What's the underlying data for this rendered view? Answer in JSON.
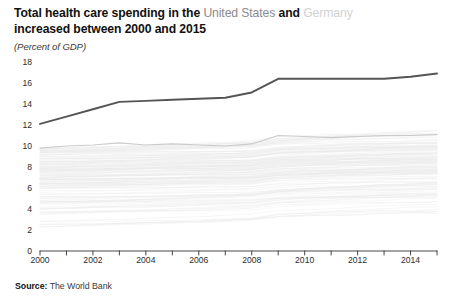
{
  "header": {
    "title_part1": "Total health care spending in the ",
    "title_highlight_us": "United States",
    "title_conjunction": " and ",
    "title_highlight_de": "Germany",
    "title_part2": "increased between 2000 and 2015",
    "subtitle": "(Percent of GDP)"
  },
  "footer": {
    "source_label": "Source:",
    "source_value": "The World Bank"
  },
  "colors": {
    "united_states_line": "#555555",
    "germany_line": "#c8c8c8",
    "other_countries_line": "#eaeaea",
    "axis": "#333333",
    "tick_text": "#2b2b2b",
    "title_muted": "#8b8b8b",
    "title_faint": "#d2d2d2"
  },
  "chart_data": {
    "type": "line",
    "subtitle": "(Percent of GDP)",
    "xlabel": "",
    "ylabel": "Percent of GDP",
    "xlim": [
      2000,
      2015
    ],
    "ylim": [
      0,
      18
    ],
    "ytick_labels": [
      "0",
      "2",
      "4",
      "6",
      "8",
      "10",
      "12",
      "14",
      "16",
      "18"
    ],
    "ytick_values": [
      0,
      2,
      4,
      6,
      8,
      10,
      12,
      14,
      16,
      18
    ],
    "xtick_labels": [
      "2000",
      "2002",
      "2004",
      "2006",
      "2008",
      "2010",
      "2012",
      "2014"
    ],
    "xtick_values": [
      2000,
      2002,
      2004,
      2006,
      2008,
      2010,
      2012,
      2014
    ],
    "xtick_minor_values": [
      2001,
      2003,
      2005,
      2007,
      2009,
      2011,
      2013,
      2015
    ],
    "grid": false,
    "legend": "none",
    "x": [
      2000,
      2001,
      2002,
      2003,
      2004,
      2005,
      2006,
      2007,
      2008,
      2009,
      2010,
      2011,
      2012,
      2013,
      2014,
      2015
    ],
    "series": [
      {
        "name": "United States",
        "emphasis": "primary",
        "color": "#555555",
        "values": [
          12.1,
          12.8,
          13.5,
          14.2,
          14.3,
          14.4,
          14.5,
          14.6,
          15.1,
          16.4,
          16.4,
          16.4,
          16.4,
          16.4,
          16.6,
          16.9
        ]
      },
      {
        "name": "Germany",
        "emphasis": "secondary",
        "color": "#c8c8c8",
        "values": [
          9.8,
          10.0,
          10.1,
          10.3,
          10.1,
          10.2,
          10.1,
          10.0,
          10.2,
          11.0,
          10.9,
          10.8,
          10.9,
          11.0,
          11.0,
          11.1
        ]
      },
      {
        "name": "Other countries",
        "emphasis": "background",
        "color": "#eaeaea",
        "note": "Approximately 150 faint background country lines clustered between roughly 2.5 and 10 percent of GDP"
      }
    ]
  }
}
